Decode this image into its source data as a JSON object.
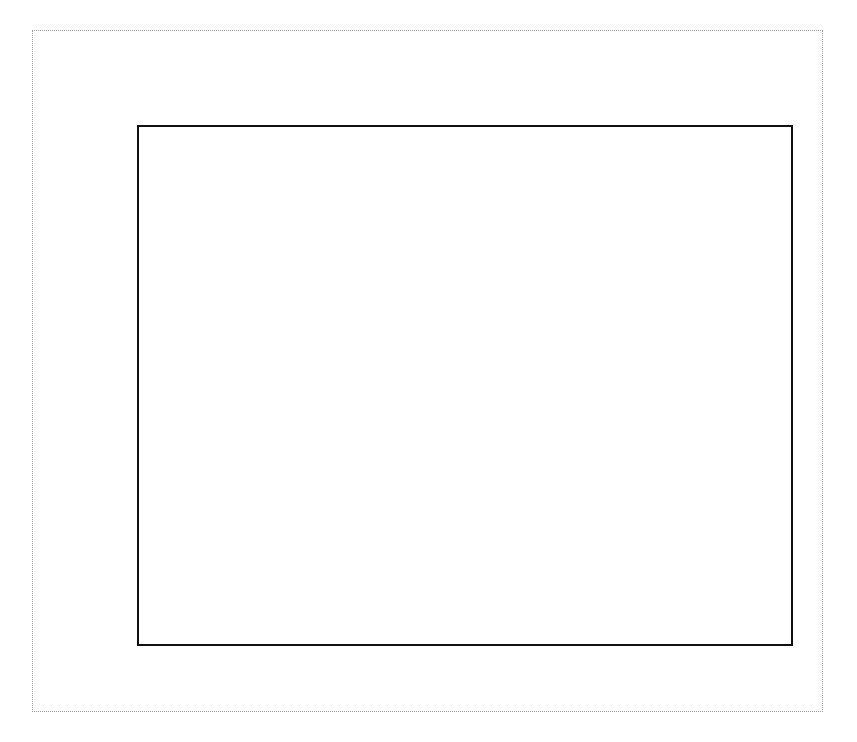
{
  "legend": {
    "position": "top-left-inside",
    "entries": [
      {
        "label": "Hydro",
        "color": "#2a3f8f"
      },
      {
        "label": "Nuclear",
        "color": "#f2f266"
      },
      {
        "label": "Fossil",
        "color": "#dd2a10"
      },
      {
        "label": "Renewables",
        "color": "#5ab84a"
      }
    ]
  },
  "axes": {
    "y_ticks": [
      "0",
      "500",
      "1000",
      "1500",
      "2000",
      "2500",
      "3000",
      "3500",
      "4000",
      "4500"
    ],
    "x_ticks": [
      "1980",
      "1990",
      "2000",
      "2010"
    ]
  },
  "chart_data": {
    "type": "area",
    "stacked": true,
    "xlabel": "",
    "ylabel": "",
    "xlim": [
      1980,
      2010
    ],
    "ylim": [
      0,
      4500
    ],
    "ytick_step": 500,
    "grid": "faint-horizontal-and-vertical",
    "x": [
      1980,
      1981,
      1982,
      1983,
      1984,
      1985,
      1986,
      1987,
      1988,
      1989,
      1990,
      1991,
      1992,
      1993,
      1994,
      1995,
      1996,
      1997,
      1998,
      1999,
      2000,
      2001,
      2002,
      2003,
      2004,
      2005,
      2006,
      2007,
      2008
    ],
    "series": [
      {
        "name": "Hydro",
        "color": "#2a3f8f",
        "values": [
          276,
          261,
          309,
          332,
          321,
          281,
          291,
          250,
          223,
          265,
          289,
          276,
          243,
          269,
          260,
          307,
          340,
          349,
          319,
          314,
          271,
          212,
          260,
          269,
          265,
          267,
          289,
          248,
          254
        ]
      },
      {
        "name": "Nuclear",
        "color": "#f2f266",
        "values": [
          251,
          273,
          283,
          294,
          328,
          384,
          414,
          455,
          527,
          529,
          577,
          613,
          619,
          610,
          640,
          673,
          675,
          629,
          674,
          728,
          754,
          769,
          780,
          764,
          789,
          782,
          787,
          806,
          806
        ]
      },
      {
        "name": "Fossil",
        "color": "#dd2a10",
        "values": [
          1766,
          1693,
          1578,
          1650,
          1722,
          1744,
          1741,
          1842,
          1974,
          2051,
          2053,
          2041,
          2083,
          2173,
          2193,
          2220,
          2310,
          2380,
          2521,
          2518,
          2669,
          2553,
          2640,
          2626,
          2710,
          2750,
          2721,
          2850,
          2800
        ]
      },
      {
        "name": "Renewables",
        "color": "#5ab84a",
        "values": [
          26,
          28,
          31,
          35,
          44,
          51,
          55,
          58,
          63,
          68,
          74,
          76,
          76,
          77,
          79,
          80,
          82,
          83,
          84,
          85,
          86,
          81,
          84,
          86,
          89,
          94,
          101,
          109,
          126
        ]
      }
    ],
    "totals": [
      2319,
      2255,
      2201,
      2311,
      2415,
      2460,
      2501,
      2605,
      2787,
      2913,
      2993,
      3006,
      3021,
      3129,
      3172,
      3280,
      3407,
      3441,
      3598,
      3645,
      3780,
      3615,
      3764,
      3745,
      3853,
      3893,
      3898,
      4013,
      3986
    ],
    "annotations": []
  }
}
